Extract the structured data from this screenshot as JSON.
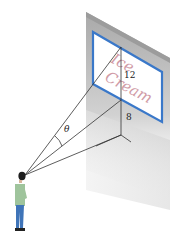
{
  "figure": {
    "billboard": {
      "text_line1": "Ice",
      "text_line2": "Cream",
      "border_color": "#3a78c9",
      "text_color": "#c98a96"
    },
    "labels": {
      "billboard_height": "12",
      "gap_below": "8",
      "angle": "θ"
    },
    "wall_color": "#b9b9b9",
    "line_color": "#333333"
  }
}
